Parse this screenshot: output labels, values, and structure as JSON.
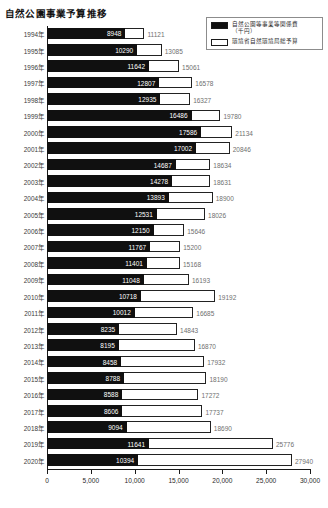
{
  "chart_data": {
    "type": "bar",
    "orientation": "horizontal",
    "overlay": true,
    "title": "自然公園事業予算推移",
    "xlabel": "",
    "ylabel": "",
    "xlim": [
      0,
      30000
    ],
    "xticks": [
      0,
      5000,
      10000,
      15000,
      20000,
      25000,
      30000
    ],
    "xtick_labels": [
      "0",
      "5,000",
      "10,000",
      "15,000",
      "20,000",
      "25,000",
      "30,000"
    ],
    "grid": false,
    "legend_position": "top-right",
    "categories": [
      "1994年",
      "1995年",
      "1996年",
      "1997年",
      "1998年",
      "1999年",
      "2000年",
      "2001年",
      "2002年",
      "2003年",
      "2004年",
      "2005年",
      "2006年",
      "2007年",
      "2008年",
      "2009年",
      "2010年",
      "2011年",
      "2012年",
      "2013年",
      "2014年",
      "2015年",
      "2016年",
      "2017年",
      "2018年",
      "2019年",
      "2020年"
    ],
    "series": [
      {
        "name": "自然公園等事業等関係費（千円）",
        "color": "#101010",
        "values": [
          8948,
          10290,
          11642,
          12807,
          12935,
          16486,
          17586,
          17002,
          14687,
          14278,
          13893,
          12531,
          12150,
          11767,
          11401,
          11048,
          10718,
          10012,
          8235,
          8195,
          8458,
          8788,
          8588,
          8606,
          9094,
          11641,
          10394
        ]
      },
      {
        "name": "環境省自然環境局総予算",
        "color": "#ffffff",
        "values": [
          11121,
          13085,
          15061,
          16578,
          16327,
          19780,
          21134,
          20846,
          18634,
          18631,
          18900,
          18026,
          15646,
          15200,
          15168,
          16193,
          19192,
          16685,
          14843,
          16870,
          17932,
          18190,
          17272,
          17737,
          18690,
          25776,
          27940
        ]
      }
    ]
  },
  "legend": {
    "entries": [
      {
        "label": "自然公園等事業等関係費",
        "label_line2": "（千円）",
        "swatch": "filled"
      },
      {
        "label": "環境省自然環境局総予算",
        "label_line2": "",
        "swatch": "hollow"
      }
    ]
  }
}
